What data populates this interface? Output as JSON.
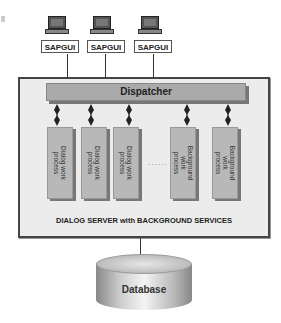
{
  "clients": [
    {
      "label": "SAPGUI"
    },
    {
      "label": "SAPGUI"
    },
    {
      "label": "SAPGUI"
    }
  ],
  "dispatcher": {
    "label": "Dispatcher"
  },
  "processes": [
    {
      "label": "Dialog work\nprocess",
      "type": "dialog"
    },
    {
      "label": "Dialog work\nprocess",
      "type": "dialog"
    },
    {
      "label": "Dialog work\nprocess",
      "type": "dialog"
    },
    {
      "label": "Background\nwork\nprocess",
      "type": "background"
    },
    {
      "label": "Background\nwork\nprocess",
      "type": "background"
    }
  ],
  "ellipsis": "......",
  "server": {
    "caption": "DIALOG SERVER with BACKGROUND SERVICES"
  },
  "database": {
    "label": "Database"
  },
  "colors": {
    "box_fill": "#ececec",
    "dispatcher": "#aaaaaa",
    "process": "#b8b8b8",
    "border": "#444444"
  }
}
